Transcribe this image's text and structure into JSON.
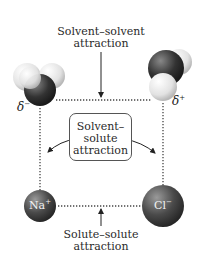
{
  "labels": {
    "solvent_solvent_line1": "Solvent–solvent",
    "solvent_solvent_line2": "attraction",
    "solvent_solute_line1": "Solvent–",
    "solvent_solute_line2": "solute",
    "solvent_solute_line3": "attraction",
    "solute_solute_line1": "Solute–solute",
    "solute_solute_line2": "attraction"
  },
  "ions": {
    "cation": "Na",
    "cation_charge": "+",
    "anion": "Cl",
    "anion_charge": "−"
  },
  "partial_charges": {
    "left_symbol": "δ",
    "left_sign": "−",
    "right_symbol": "δ",
    "right_sign": "+"
  },
  "colors": {
    "oxygen": "#3a3a3a",
    "hydrogen": "#e8e8e8",
    "ion": "#4a4a4a",
    "dotted": "#444444"
  }
}
